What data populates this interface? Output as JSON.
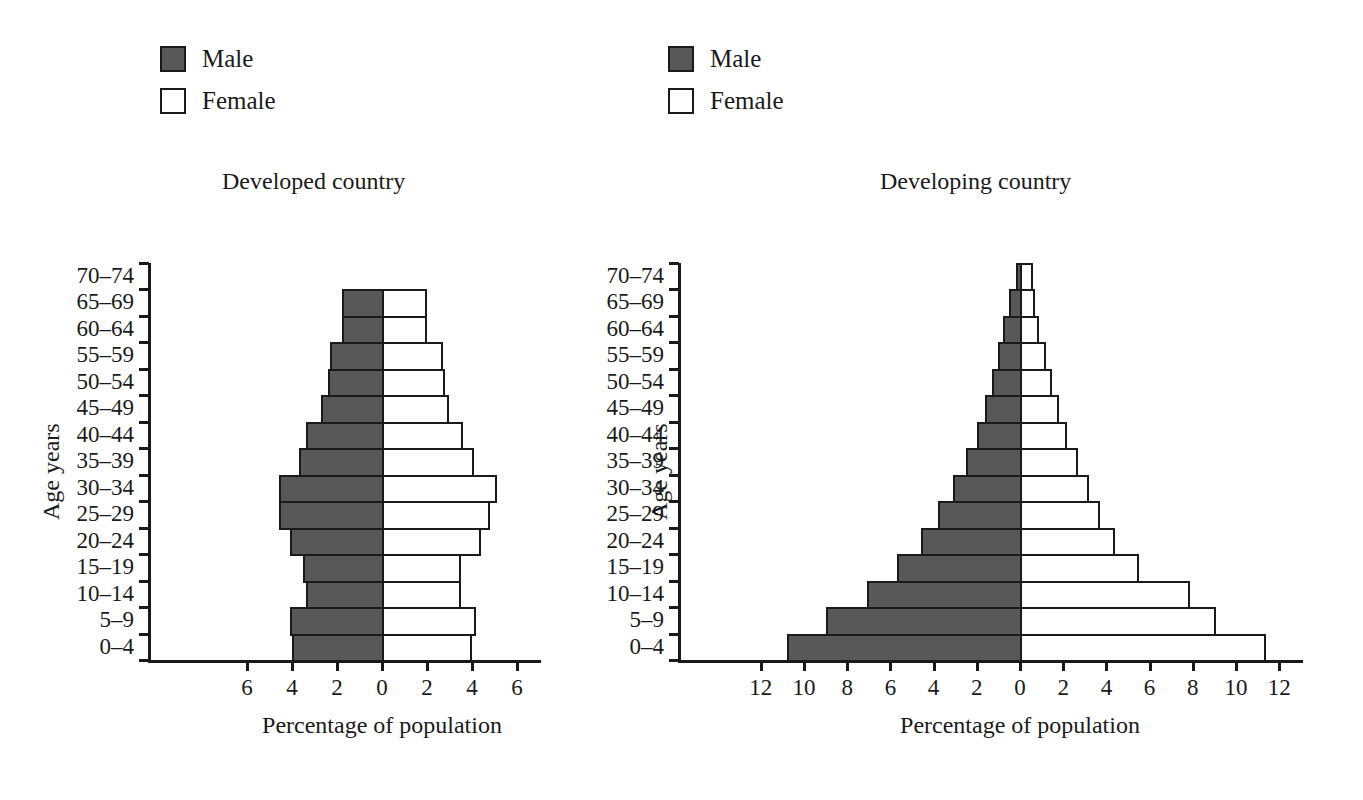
{
  "legend": {
    "male_label": "Male",
    "female_label": "Female",
    "male_color": "#585858",
    "female_color": "#ffffff",
    "border_color": "#1a1a1a"
  },
  "axis_captions": {
    "x": "Percentage of population",
    "y": "Age years"
  },
  "chart_data": [
    {
      "type": "bar",
      "title": "Developed country",
      "orientation": "population-pyramid",
      "xlabel": "Percentage of population",
      "ylabel": "Age years",
      "xlim": [
        -7,
        7
      ],
      "xtick_values": [
        -6,
        -4,
        -2,
        0,
        2,
        4,
        6
      ],
      "xtick_labels": [
        "6",
        "4",
        "2",
        "0",
        "2",
        "4",
        "6"
      ],
      "grid": false,
      "legend_position": "above-left",
      "categories": [
        "0–4",
        "5–9",
        "10–14",
        "15–19",
        "20–24",
        "25–29",
        "30–34",
        "35–39",
        "40–44",
        "45–49",
        "50–54",
        "55–59",
        "60–64",
        "65–69",
        "70–74"
      ],
      "series": [
        {
          "name": "Male",
          "color": "#585858",
          "side": "left",
          "values": [
            4.0,
            4.1,
            3.4,
            3.5,
            4.1,
            4.6,
            4.6,
            3.7,
            3.4,
            2.7,
            2.4,
            2.3,
            1.8,
            1.8,
            0.0
          ]
        },
        {
          "name": "Female",
          "color": "#ffffff",
          "side": "right",
          "values": [
            3.9,
            4.1,
            3.4,
            3.4,
            4.3,
            4.7,
            5.0,
            4.0,
            3.5,
            2.9,
            2.7,
            2.6,
            1.9,
            1.9,
            0.0
          ]
        }
      ]
    },
    {
      "type": "bar",
      "title": "Developing country",
      "orientation": "population-pyramid",
      "xlabel": "Percentage of population",
      "ylabel": "Age years",
      "xlim": [
        -13.5,
        13.5
      ],
      "xtick_values": [
        -12,
        -10,
        -8,
        -6,
        -4,
        -2,
        0,
        2,
        4,
        6,
        8,
        10,
        12
      ],
      "xtick_labels": [
        "12",
        "10",
        "8",
        "6",
        "4",
        "2",
        "0",
        "2",
        "4",
        "6",
        "8",
        "10",
        "12"
      ],
      "grid": false,
      "legend_position": "above-left",
      "categories": [
        "0–4",
        "5–9",
        "10–14",
        "15–19",
        "20–24",
        "25–29",
        "30–34",
        "35–39",
        "40–44",
        "45–49",
        "50–54",
        "55–59",
        "60–64",
        "65–69",
        "70–74"
      ],
      "series": [
        {
          "name": "Male",
          "color": "#585858",
          "side": "left",
          "values": [
            10.8,
            9.0,
            7.1,
            5.7,
            4.6,
            3.8,
            3.1,
            2.5,
            2.0,
            1.6,
            1.3,
            1.0,
            0.8,
            0.5,
            0.2
          ]
        },
        {
          "name": "Female",
          "color": "#ffffff",
          "side": "right",
          "values": [
            11.3,
            9.0,
            7.8,
            5.4,
            4.3,
            3.6,
            3.1,
            2.6,
            2.1,
            1.7,
            1.4,
            1.1,
            0.8,
            0.6,
            0.5
          ]
        }
      ]
    }
  ]
}
